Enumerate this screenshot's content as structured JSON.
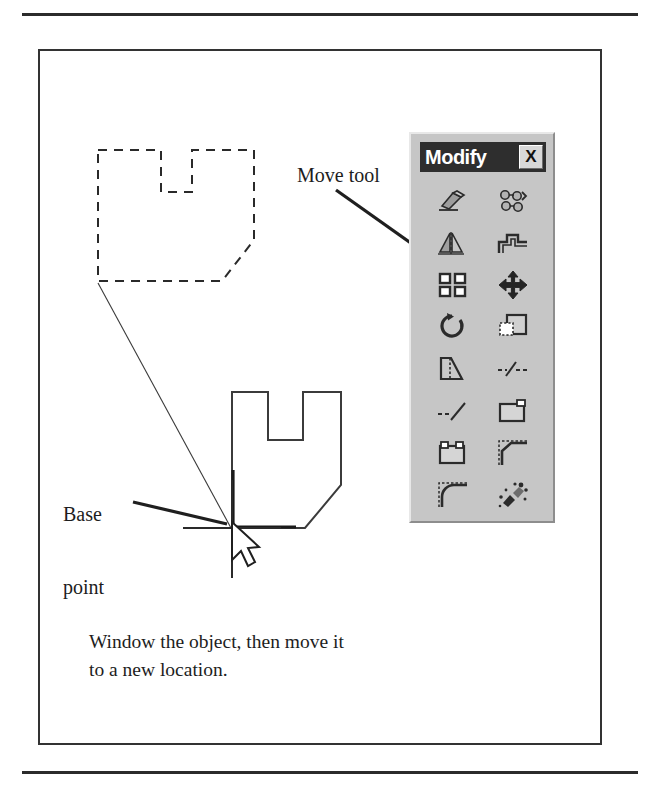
{
  "figure": {
    "caption": "Window the object, then move it to a new location.",
    "caption_line1": "Window the object, then move it",
    "caption_line2": "to a new location.",
    "annotations": {
      "move_tool_label": "Move tool",
      "base_point_label_line1": "Base",
      "base_point_label_line2": "point"
    }
  },
  "toolbar": {
    "title": "Modify",
    "close_label": "X",
    "buttons": [
      {
        "icon": "erase-icon",
        "label": "Erase"
      },
      {
        "icon": "copy-object-icon",
        "label": "Copy Object"
      },
      {
        "icon": "mirror-icon",
        "label": "Mirror"
      },
      {
        "icon": "offset-icon",
        "label": "Offset"
      },
      {
        "icon": "array-icon",
        "label": "Array"
      },
      {
        "icon": "move-icon",
        "label": "Move"
      },
      {
        "icon": "rotate-icon",
        "label": "Rotate"
      },
      {
        "icon": "scale-icon",
        "label": "Scale"
      },
      {
        "icon": "stretch-icon",
        "label": "Stretch"
      },
      {
        "icon": "trim-icon",
        "label": "Trim"
      },
      {
        "icon": "extend-icon",
        "label": "Extend"
      },
      {
        "icon": "break-at-point-icon",
        "label": "Break at Point"
      },
      {
        "icon": "break-icon",
        "label": "Break"
      },
      {
        "icon": "chamfer-icon",
        "label": "Chamfer"
      },
      {
        "icon": "fillet-icon",
        "label": "Fillet"
      },
      {
        "icon": "explode-icon",
        "label": "Explode"
      }
    ]
  },
  "drawing": {
    "ghost_object_style": "dashed",
    "target_object_style": "solid",
    "cursor": "arrow-with-crosshair",
    "base_point_marker": "crosshair"
  },
  "colors": {
    "ink": "#1d1d1d",
    "rule": "#2b2b2b",
    "frame": "#333333",
    "toolbar_face": "#c6c6c6",
    "toolbar_titlebar": "#2e2e2e",
    "toolbar_title_text": "#ffffff",
    "page_background": "#ffffff"
  }
}
